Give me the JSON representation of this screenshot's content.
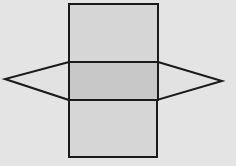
{
  "diagram": {
    "type": "triangular-prism-net",
    "background": "#e4e4e4",
    "stroke": "#1a1a1a",
    "faces": {
      "top_rect": {
        "x": 69,
        "y": 4,
        "w": 89,
        "h": 58,
        "fill": "#d6d6d6"
      },
      "middle_rect": {
        "x": 69,
        "y": 62,
        "w": 89,
        "h": 38,
        "fill": "#c8c8c8"
      },
      "bottom_rect": {
        "x": 69,
        "y": 100,
        "w": 88,
        "h": 57,
        "fill": "#d6d6d6"
      },
      "left_triangle": {
        "points": "69,62 5,79 69,100",
        "fill": "#e2e2e2"
      },
      "right_triangle": {
        "points": "158,62 222,81 157,100",
        "fill": "#e2e2e2"
      }
    }
  }
}
